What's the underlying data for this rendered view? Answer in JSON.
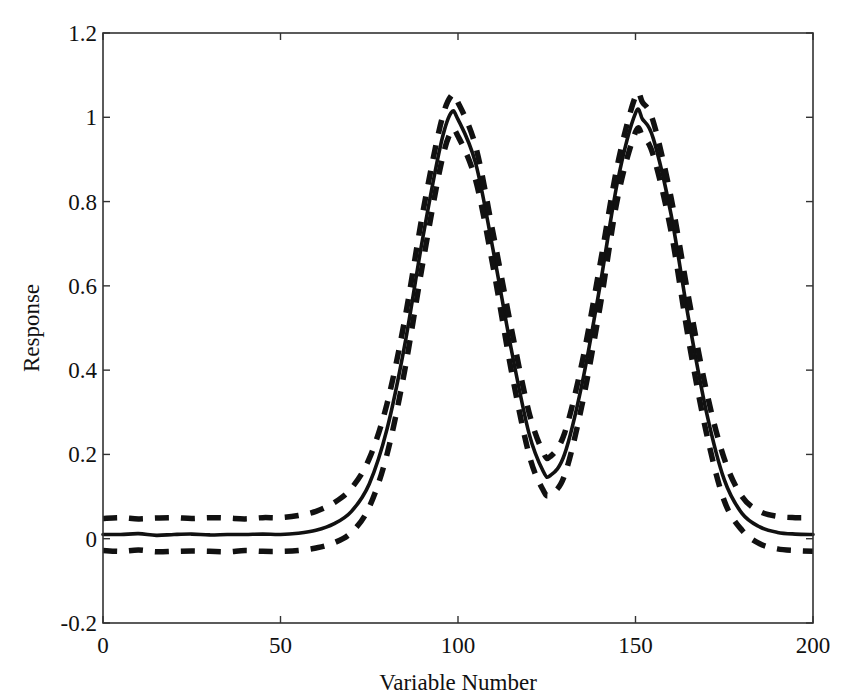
{
  "chart_data": {
    "type": "line",
    "title": "",
    "xlabel": "Variable Number",
    "ylabel": "Response",
    "xlim": [
      0,
      200
    ],
    "ylim": [
      -0.2,
      1.2
    ],
    "xticks": [
      0,
      50,
      100,
      150,
      200
    ],
    "yticks": [
      -0.2,
      0,
      0.2,
      0.4,
      0.6,
      0.8,
      1,
      1.2
    ],
    "xtick_labels": [
      "0",
      "50",
      "100",
      "150",
      "200"
    ],
    "ytick_labels": [
      "-0.2",
      "0",
      "0.2",
      "0.4",
      "0.6",
      "0.8",
      "1",
      "1.2"
    ],
    "grid": false,
    "legend": null,
    "x": [
      0,
      5,
      10,
      15,
      20,
      25,
      30,
      35,
      40,
      45,
      50,
      55,
      60,
      65,
      70,
      75,
      80,
      85,
      90,
      95,
      98,
      100,
      105,
      110,
      115,
      120,
      124,
      126,
      130,
      135,
      140,
      145,
      150,
      152,
      155,
      160,
      165,
      170,
      175,
      180,
      185,
      190,
      195,
      200
    ],
    "series": [
      {
        "name": "mean",
        "style": "solid",
        "values": [
          0.01,
          0.01,
          0.012,
          0.008,
          0.01,
          0.011,
          0.009,
          0.01,
          0.01,
          0.011,
          0.01,
          0.013,
          0.02,
          0.035,
          0.065,
          0.13,
          0.26,
          0.46,
          0.71,
          0.93,
          1.01,
          0.995,
          0.89,
          0.68,
          0.45,
          0.25,
          0.16,
          0.15,
          0.2,
          0.37,
          0.6,
          0.85,
          1.01,
          0.995,
          0.95,
          0.77,
          0.52,
          0.3,
          0.14,
          0.06,
          0.028,
          0.015,
          0.011,
          0.01
        ]
      },
      {
        "name": "upper bound",
        "style": "dashed",
        "values": [
          0.048,
          0.05,
          0.047,
          0.049,
          0.05,
          0.048,
          0.05,
          0.049,
          0.047,
          0.05,
          0.05,
          0.055,
          0.065,
          0.085,
          0.12,
          0.19,
          0.32,
          0.52,
          0.77,
          0.98,
          1.05,
          1.035,
          0.93,
          0.72,
          0.5,
          0.3,
          0.205,
          0.195,
          0.25,
          0.42,
          0.65,
          0.89,
          1.05,
          1.035,
          0.99,
          0.81,
          0.57,
          0.35,
          0.19,
          0.1,
          0.065,
          0.053,
          0.05,
          0.05
        ]
      },
      {
        "name": "lower bound",
        "style": "dashed",
        "values": [
          -0.028,
          -0.03,
          -0.027,
          -0.031,
          -0.03,
          -0.029,
          -0.03,
          -0.031,
          -0.028,
          -0.03,
          -0.03,
          -0.028,
          -0.022,
          -0.01,
          0.015,
          0.075,
          0.2,
          0.4,
          0.65,
          0.88,
          0.965,
          0.955,
          0.85,
          0.64,
          0.4,
          0.2,
          0.115,
          0.105,
          0.15,
          0.32,
          0.55,
          0.81,
          0.965,
          0.955,
          0.91,
          0.73,
          0.47,
          0.25,
          0.09,
          0.02,
          -0.012,
          -0.024,
          -0.028,
          -0.03
        ]
      }
    ],
    "annotations": []
  },
  "colors": {
    "line": "#111111",
    "axis": "#333333",
    "background": "#ffffff"
  }
}
